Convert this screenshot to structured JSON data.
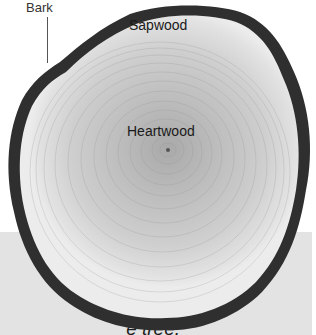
{
  "figure": {
    "labels": {
      "bark": "Bark",
      "sapwood": "Sapwood",
      "heartwood": "Heartwood"
    },
    "caption_fragments": [
      "k",
      "lder,",
      "",
      "e tree."
    ]
  },
  "colors": {
    "panel": "#e3e3e3",
    "bark": "#2e2e2e",
    "sapwood": "#d8d8d8",
    "heartwood": "#b8b8b8"
  }
}
